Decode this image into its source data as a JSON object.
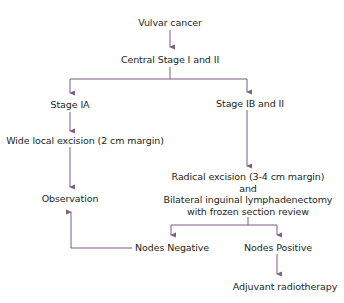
{
  "diagram": {
    "type": "flowchart",
    "edge_color": "#7d5f80",
    "text_color": "#231f20",
    "nodes": {
      "root": "Vulvar cancer",
      "central": "Central Stage I and II",
      "stage_ia": "Stage IA",
      "stage_ib": "Stage IB and II",
      "wle": "Wide local excision (2 cm margin)",
      "observation": "Observation",
      "radical_line1": "Radical excision (3-4 cm margin)",
      "radical_line2": "and",
      "radical_line3": "Bilateral inguinal lymphadenectomy",
      "radical_line4": "with frozen section review",
      "nodes_negative": "Nodes Negative",
      "nodes_positive": "Nodes Positive",
      "adjuvant": "Adjuvant radiotherapy"
    },
    "edges": [
      {
        "from": "Vulvar cancer",
        "to": "Central Stage I and II"
      },
      {
        "from": "Central Stage I and II",
        "to": "Stage IA"
      },
      {
        "from": "Central Stage I and II",
        "to": "Stage IB and II"
      },
      {
        "from": "Stage IA",
        "to": "Wide local excision (2 cm margin)"
      },
      {
        "from": "Wide local excision (2 cm margin)",
        "to": "Observation"
      },
      {
        "from": "Stage IB and II",
        "to": "Radical excision (3-4 cm margin) and Bilateral inguinal lymphadenectomy with frozen section review"
      },
      {
        "from": "Radical excision ...",
        "to": "Nodes Negative"
      },
      {
        "from": "Radical excision ...",
        "to": "Nodes Positive"
      },
      {
        "from": "Nodes Negative",
        "to": "Observation"
      },
      {
        "from": "Nodes Positive",
        "to": "Adjuvant radiotherapy"
      }
    ]
  }
}
